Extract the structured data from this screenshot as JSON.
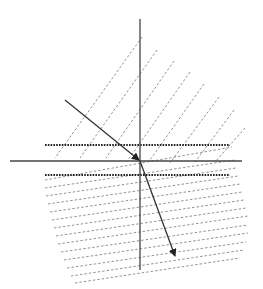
{
  "diagram": {
    "title": "",
    "colors": {
      "background": "#ffffff",
      "axis": "#444444",
      "ray": "#333333",
      "wavefront": "#777777",
      "boundary_dotted": "#222222"
    },
    "axes": {
      "vertical": {
        "x": 140,
        "y1": 19,
        "y2": 270
      },
      "horizontal": {
        "y": 161,
        "x1": 10,
        "x2": 242
      }
    },
    "dotted_boundaries": [
      {
        "y": 145,
        "x1": 45,
        "x2": 230
      },
      {
        "y": 175,
        "x1": 45,
        "x2": 230
      }
    ],
    "incident_ray": {
      "x1": 65,
      "y1": 100,
      "x2": 139,
      "y2": 160
    },
    "refracted_ray": {
      "x1": 140,
      "y1": 161,
      "x2": 175,
      "y2": 256
    },
    "upper_wavefronts": [
      {
        "x1": 142,
        "y1": 37,
        "x2": 55,
        "y2": 158
      },
      {
        "x1": 157,
        "y1": 50,
        "x2": 80,
        "y2": 158
      },
      {
        "x1": 174,
        "y1": 61,
        "x2": 106,
        "y2": 158
      },
      {
        "x1": 190,
        "y1": 72,
        "x2": 128,
        "y2": 160
      },
      {
        "x1": 204,
        "y1": 84,
        "x2": 150,
        "y2": 160
      },
      {
        "x1": 219,
        "y1": 97,
        "x2": 170,
        "y2": 163
      },
      {
        "x1": 234,
        "y1": 110,
        "x2": 195,
        "y2": 162
      },
      {
        "x1": 245,
        "y1": 128,
        "x2": 215,
        "y2": 162
      }
    ],
    "lower_wavefronts": [
      {
        "x1": 45,
        "y1": 180,
        "x2": 232,
        "y2": 147
      },
      {
        "x1": 45,
        "y1": 188,
        "x2": 235,
        "y2": 160
      },
      {
        "x1": 46,
        "y1": 196,
        "x2": 236,
        "y2": 168
      },
      {
        "x1": 48,
        "y1": 204,
        "x2": 238,
        "y2": 176
      },
      {
        "x1": 50,
        "y1": 212,
        "x2": 240,
        "y2": 184
      },
      {
        "x1": 52,
        "y1": 220,
        "x2": 242,
        "y2": 192
      },
      {
        "x1": 54,
        "y1": 228,
        "x2": 244,
        "y2": 200
      },
      {
        "x1": 56,
        "y1": 236,
        "x2": 246,
        "y2": 208
      },
      {
        "x1": 58,
        "y1": 244,
        "x2": 248,
        "y2": 216
      },
      {
        "x1": 61,
        "y1": 252,
        "x2": 248,
        "y2": 225
      },
      {
        "x1": 64,
        "y1": 260,
        "x2": 248,
        "y2": 233
      },
      {
        "x1": 67,
        "y1": 268,
        "x2": 246,
        "y2": 242
      },
      {
        "x1": 71,
        "y1": 276,
        "x2": 244,
        "y2": 250
      },
      {
        "x1": 75,
        "y1": 283,
        "x2": 240,
        "y2": 258
      }
    ]
  }
}
